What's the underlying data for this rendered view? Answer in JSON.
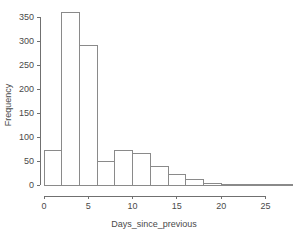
{
  "chart_data": {
    "type": "bar",
    "title": "",
    "subtitle": "",
    "xlabel": "Days_since_previous",
    "ylabel": "Frequency",
    "grid": false,
    "legend": null,
    "legend_position": "none",
    "bin_width": 2,
    "bin_edges": [
      0,
      2,
      4,
      6,
      8,
      10,
      12,
      14,
      16,
      18,
      20,
      22,
      24,
      26,
      28
    ],
    "categories": [
      "0-2",
      "2-4",
      "4-6",
      "6-8",
      "8-10",
      "10-12",
      "12-14",
      "14-16",
      "16-18",
      "18-20",
      "20-22",
      "22-24",
      "24-26",
      "26-28"
    ],
    "values": [
      72,
      360,
      291,
      49,
      72,
      66,
      38,
      22,
      11,
      3,
      1,
      2,
      1,
      1
    ],
    "x": [
      1,
      3,
      5,
      7,
      9,
      11,
      13,
      15,
      17,
      19,
      21,
      23,
      25,
      27
    ],
    "xlim": [
      0,
      28
    ],
    "ylim": [
      0,
      365
    ],
    "xticks": [
      0,
      5,
      10,
      15,
      20,
      25
    ],
    "xticklabels": [
      "0",
      "5",
      "10",
      "15",
      "20",
      "25"
    ],
    "yticks": [
      0,
      50,
      100,
      150,
      200,
      250,
      300,
      350
    ],
    "yticklabels": [
      "0",
      "50",
      "100",
      "150",
      "200",
      "250",
      "300",
      "350"
    ],
    "bar_fill_color": "#ffffff",
    "bar_edge_color": "#8a8a8a",
    "axis_color": "#707070",
    "text_color": "#4a4a4a",
    "background_color": "#ffffff"
  }
}
